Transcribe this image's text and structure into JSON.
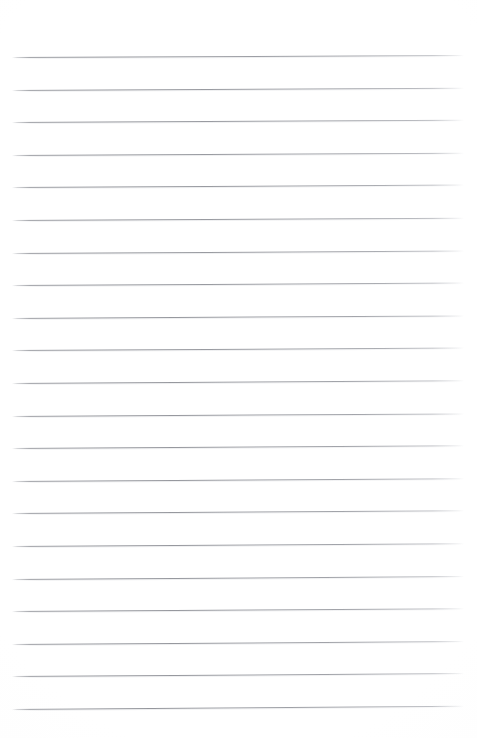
{
  "document": {
    "type": "scanned-lined-paper",
    "title": "Blank ruled notepad page",
    "content_text": "",
    "page_width_px": 477,
    "page_height_px": 738,
    "background_color": "#ffffff",
    "rule_color": "#92949a",
    "rule_thickness_px": 1,
    "rule_left_x_px": 12,
    "rule_right_x_px": 464,
    "first_rule_y_px": 57,
    "rule_spacing_px": 32.6,
    "rule_count": 21,
    "scan_skew_deg": -0.3,
    "top_margin_px": 57,
    "bottom_margin_px": 28,
    "has_text": false,
    "has_margin_line": false,
    "has_holes": false,
    "rules": [
      {
        "index": 1,
        "y": 57.0,
        "skew": -0.26
      },
      {
        "index": 2,
        "y": 89.6,
        "skew": -0.28
      },
      {
        "index": 3,
        "y": 122.2,
        "skew": -0.3
      },
      {
        "index": 4,
        "y": 154.8,
        "skew": -0.3
      },
      {
        "index": 5,
        "y": 187.4,
        "skew": -0.31
      },
      {
        "index": 6,
        "y": 220.0,
        "skew": -0.3
      },
      {
        "index": 7,
        "y": 252.6,
        "skew": -0.32
      },
      {
        "index": 8,
        "y": 285.2,
        "skew": -0.31
      },
      {
        "index": 9,
        "y": 317.8,
        "skew": -0.33
      },
      {
        "index": 10,
        "y": 350.4,
        "skew": -0.32
      },
      {
        "index": 11,
        "y": 383.0,
        "skew": -0.34
      },
      {
        "index": 12,
        "y": 415.6,
        "skew": -0.33
      },
      {
        "index": 13,
        "y": 448.2,
        "skew": -0.35
      },
      {
        "index": 14,
        "y": 480.8,
        "skew": -0.34
      },
      {
        "index": 15,
        "y": 513.4,
        "skew": -0.36
      },
      {
        "index": 16,
        "y": 546.0,
        "skew": -0.35
      },
      {
        "index": 17,
        "y": 578.6,
        "skew": -0.37
      },
      {
        "index": 18,
        "y": 611.2,
        "skew": -0.36
      },
      {
        "index": 19,
        "y": 643.8,
        "skew": -0.38
      },
      {
        "index": 20,
        "y": 676.4,
        "skew": -0.37
      },
      {
        "index": 21,
        "y": 709.0,
        "skew": -0.4
      }
    ]
  }
}
